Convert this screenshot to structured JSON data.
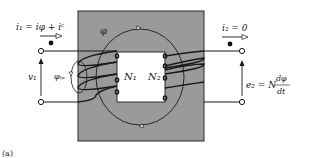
{
  "figure": {
    "label": "(a)",
    "colors": {
      "core_fill": "#9a9a9a",
      "core_stroke": "#2a2a2a",
      "wire": "#1a1a1a",
      "window": "#ffffff"
    },
    "labels": {
      "primary_current": "i₁ = iφ + iᶜ",
      "secondary_current": "i₂ = 0",
      "flux": "φ",
      "primary_voltage": "v₁",
      "leakage_flux": "φₗₚ",
      "primary_turns": "N₁",
      "secondary_turns": "N₂",
      "emf_lhs": "e₂ = N",
      "emf_num": "dφ",
      "emf_den": "dt"
    },
    "symbols": {
      "polarity_dot_primary": "dot",
      "polarity_dot_secondary": "dot",
      "terminal": "open-circle",
      "current_arrow": "arrow-right",
      "voltage_arrow": "arrow-up"
    }
  }
}
